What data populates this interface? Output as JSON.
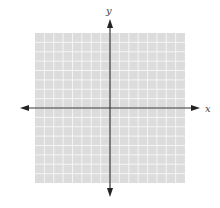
{
  "diagram": {
    "type": "coordinate-plane",
    "grid": {
      "cells_x": 16,
      "cells_y": 16,
      "background_color": "#dcdcdc",
      "line_color": "#f4f4f4"
    },
    "axes": {
      "x_label": "x",
      "y_label": "y",
      "color": "#333333"
    }
  }
}
